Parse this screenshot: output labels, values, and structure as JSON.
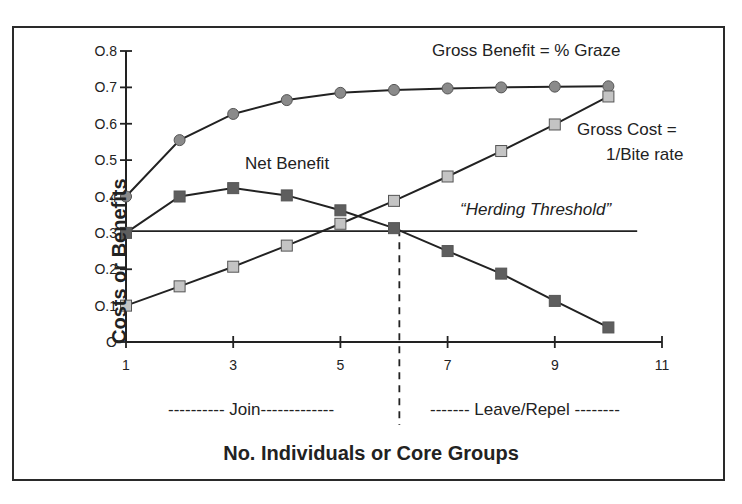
{
  "chart_data": {
    "type": "line",
    "title": "",
    "xlabel": "No. Individuals or Core Groups",
    "ylabel": "Costs or Benefits",
    "xlim": [
      1,
      11
    ],
    "ylim": [
      0,
      0.8
    ],
    "x_ticks": [
      "1",
      "3",
      "5",
      "7",
      "9",
      "11"
    ],
    "y_ticks": [
      "O",
      "O.1",
      "O.2",
      "O.3",
      "O.4",
      "O.5",
      "O.6",
      "O.7",
      "O.8"
    ],
    "grid": false,
    "legend": "none (inline annotations)",
    "x": [
      1,
      2,
      3,
      4,
      5,
      6,
      7,
      8,
      9,
      10
    ],
    "series": [
      {
        "name": "Gross Benefit = % Graze",
        "marker": "circle",
        "color": "#8a8a8a",
        "values": [
          0.4,
          0.555,
          0.627,
          0.665,
          0.685,
          0.693,
          0.697,
          0.7,
          0.702,
          0.703
        ]
      },
      {
        "name": "Gross Cost = 1/Bite rate",
        "marker": "square",
        "color": "#c4c4c4",
        "values": [
          0.1,
          0.153,
          0.207,
          0.265,
          0.325,
          0.388,
          0.455,
          0.525,
          0.598,
          0.675
        ]
      },
      {
        "name": "Net Benefit",
        "marker": "square",
        "color": "#5e5e5e",
        "values": [
          0.3,
          0.4,
          0.423,
          0.403,
          0.362,
          0.313,
          0.25,
          0.188,
          0.113,
          0.04
        ]
      }
    ],
    "reference_lines": [
      {
        "type": "horizontal",
        "y": 0.305,
        "x_from": 1,
        "x_to": 10.5,
        "label": "“Herding Threshold”"
      },
      {
        "type": "vertical-dashed",
        "x": 6.1,
        "y_from": 0.31,
        "label": "Join / Leave divide"
      }
    ],
    "annotations": [
      "Gross Benefit = % Graze",
      "Gross Cost =",
      "1/Bite rate",
      "Net Benefit",
      "“Herding Threshold”",
      "---------- Join-------------",
      "------- Leave/Repel --------"
    ]
  },
  "labels": {
    "ylabel": "Costs or Benefits",
    "xlabel": "No. Individuals or Core Groups",
    "gross_benefit": "Gross Benefit = % Graze",
    "gross_cost_1": "Gross Cost =",
    "gross_cost_2": "1/Bite rate",
    "net_benefit": "Net Benefit",
    "threshold": "“Herding Threshold”",
    "join": "---------- Join-------------",
    "leave": "------- Leave/Repel --------"
  }
}
